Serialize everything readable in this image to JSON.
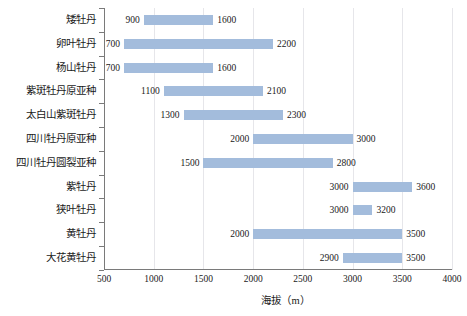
{
  "chart_data": {
    "type": "bar",
    "subtype": "floating-range-bar",
    "title": "",
    "xlabel": "海拔（m）",
    "ylabel": "",
    "xlim": [
      500,
      4000
    ],
    "xticks": [
      500,
      1000,
      1500,
      2000,
      2500,
      3000,
      3500,
      4000
    ],
    "xtick_labels": [
      "500",
      "1000",
      "1500",
      "2000",
      "2500",
      "3000",
      "3500",
      "4000"
    ],
    "grid": "vertical",
    "legend": "none",
    "bar_color": "#a3bcdc",
    "axis_color": "#7a7a7a",
    "grid_color": "#e6e6ea",
    "categories": [
      "矮牡丹",
      "卵叶牡丹",
      "杨山牡丹",
      "紫斑牡丹原亚种",
      "太白山紫斑牡丹",
      "四川牡丹原亚种",
      "四川牡丹圆裂亚种",
      "紫牡丹",
      "狭叶牡丹",
      "黄牡丹",
      "大花黄牡丹"
    ],
    "series": [
      {
        "name": "最低海拔",
        "values": [
          900,
          700,
          700,
          1100,
          1300,
          2000,
          1500,
          3000,
          3000,
          2000,
          2900
        ]
      },
      {
        "name": "最高海拔",
        "values": [
          1600,
          2200,
          1600,
          2100,
          2300,
          3000,
          2800,
          3600,
          3200,
          3500,
          3500
        ]
      }
    ],
    "bars": [
      {
        "category": "矮牡丹",
        "low": 900,
        "high": 1600,
        "low_label": "900",
        "high_label": "1600"
      },
      {
        "category": "卵叶牡丹",
        "low": 700,
        "high": 2200,
        "low_label": "700",
        "high_label": "2200"
      },
      {
        "category": "杨山牡丹",
        "low": 700,
        "high": 1600,
        "low_label": "700",
        "high_label": "1600"
      },
      {
        "category": "紫斑牡丹原亚种",
        "low": 1100,
        "high": 2100,
        "low_label": "1100",
        "high_label": "2100"
      },
      {
        "category": "太白山紫斑牡丹",
        "low": 1300,
        "high": 2300,
        "low_label": "1300",
        "high_label": "2300"
      },
      {
        "category": "四川牡丹原亚种",
        "low": 2000,
        "high": 3000,
        "low_label": "2000",
        "high_label": "3000"
      },
      {
        "category": "四川牡丹圆裂亚种",
        "low": 1500,
        "high": 2800,
        "low_label": "1500",
        "high_label": "2800"
      },
      {
        "category": "紫牡丹",
        "low": 3000,
        "high": 3600,
        "low_label": "3000",
        "high_label": "3600"
      },
      {
        "category": "狭叶牡丹",
        "low": 3000,
        "high": 3200,
        "low_label": "3000",
        "high_label": "3200"
      },
      {
        "category": "黄牡丹",
        "low": 2000,
        "high": 3500,
        "low_label": "2000",
        "high_label": "3500"
      },
      {
        "category": "大花黄牡丹",
        "low": 2900,
        "high": 3500,
        "low_label": "2900",
        "high_label": "3500"
      }
    ]
  }
}
